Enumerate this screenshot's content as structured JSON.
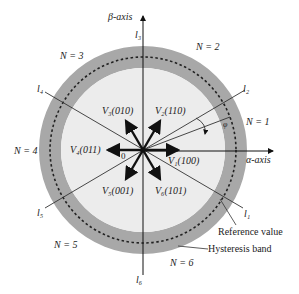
{
  "diagram": {
    "axes": {
      "alpha": "α-axis",
      "beta": "β-axis"
    },
    "sectors": [
      "N = 1",
      "N = 2",
      "N = 3",
      "N = 4",
      "N = 5",
      "N = 6"
    ],
    "boundaries": [
      "l1",
      "l2",
      "l3",
      "l4",
      "l5",
      "l6"
    ],
    "boundary_labels": {
      "l1": "l₁",
      "l2": "l₂",
      "l3": "l₃",
      "l4": "l₄",
      "l5": "l₅",
      "l6": "l₆"
    },
    "vectors": [
      {
        "name": "V1",
        "code": "(100)",
        "label": "V₁(100)"
      },
      {
        "name": "V2",
        "code": "(110)",
        "label": "V₂(110)"
      },
      {
        "name": "V3",
        "code": "(010)",
        "label": "V₃(010)"
      },
      {
        "name": "V4",
        "code": "(011)",
        "label": "V₄(011)"
      },
      {
        "name": "V5",
        "code": "(001)",
        "label": "V₅(001)"
      },
      {
        "name": "V6",
        "code": "(101)",
        "label": "V₆(101)"
      }
    ],
    "origin": "0",
    "angle": "φ",
    "annotations": {
      "reference": "Reference value",
      "hysteresis": "Hysteresis band"
    },
    "colors": {
      "band": "#a8a8a8",
      "inner": "#ececec",
      "line": "#111111"
    }
  }
}
